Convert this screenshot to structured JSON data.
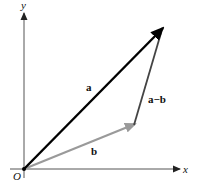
{
  "diagram": {
    "origin_label": "O",
    "x_axis_label": "x",
    "y_axis_label": "y",
    "vectors": [
      {
        "name": "a",
        "label": "a",
        "from": "O",
        "color": "#000000"
      },
      {
        "name": "b",
        "label": "b",
        "from": "O",
        "color": "#9a9a9a"
      },
      {
        "name": "a-b",
        "label": "a−b",
        "from": "tip of b",
        "to": "tip of a",
        "color": "#444444"
      }
    ],
    "colors": {
      "axis": "#555555",
      "vector_a": "#000000",
      "vector_b": "#9a9a9a",
      "vector_a_minus_b": "#444444"
    }
  }
}
